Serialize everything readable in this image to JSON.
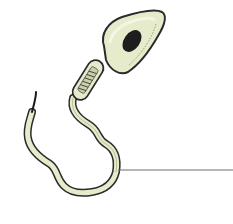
{
  "diagram": {
    "parts": [
      {
        "id": "head",
        "name": "head"
      },
      {
        "id": "nucleus",
        "name": "nucleus"
      },
      {
        "id": "midpiece",
        "name": "midpiece"
      },
      {
        "id": "tail",
        "name": "tail"
      }
    ],
    "leader_lines": [
      {
        "points_to": "tail",
        "from": [
          118,
          170
        ],
        "to": [
          233,
          170
        ],
        "label": ""
      }
    ],
    "colors": {
      "body_fill": "#e6eccb",
      "body_highlight": "#f3f6e2",
      "outline": "#2b2b2b",
      "nucleus": "#1e1e1e",
      "leader_line": "#6e6e6e",
      "background": "#ffffff"
    }
  }
}
